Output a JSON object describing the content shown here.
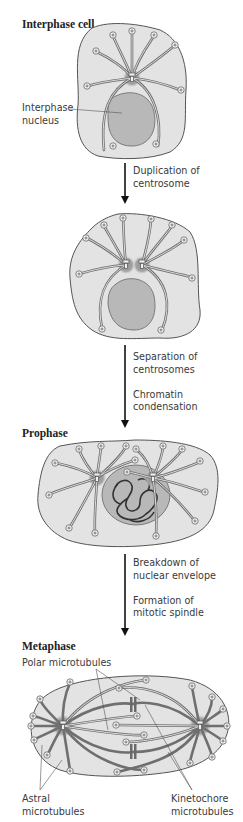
{
  "stages": [
    {
      "id": "interphase",
      "title": "Interphase cell"
    },
    {
      "id": "duplicated",
      "title": ""
    },
    {
      "id": "prophase",
      "title": "Prophase"
    },
    {
      "id": "metaphase",
      "title": "Metaphase"
    }
  ],
  "labels": {
    "interphase_nucleus": "Interphase\nnucleus",
    "polar_microtubules": "Polar microtubules",
    "astral_microtubules": "Astral\nmicrotubules",
    "kinetochore_microtubules": "Kinetochore\nmicrotubules"
  },
  "transitions": [
    {
      "text": "Duplication of\ncentrosome"
    },
    {
      "text": "Separation of\ncentrosomes\n\nChromatin\ncondensation"
    },
    {
      "text": "Breakdown of\nnuclear envelope\n\nFormation of\nmitotic spindle"
    }
  ],
  "colors": {
    "cytoplasm": "#e3e3e3",
    "cell_outline": "#555555",
    "nucleus": "#b8b8b8",
    "centrosome": "#9a9a9a",
    "microtubule": "#6f6f6f",
    "text": "#333333"
  }
}
